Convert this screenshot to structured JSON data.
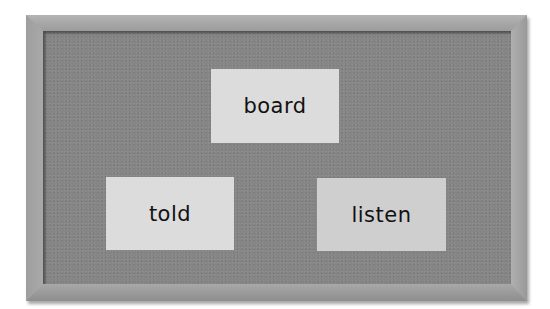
{
  "board": {
    "frame_color": "#a3a3a3",
    "felt_color": "#858585",
    "cards": [
      {
        "word": "board",
        "color": "#dcdcdc"
      },
      {
        "word": "told",
        "color": "#dcdcdc"
      },
      {
        "word": "listen",
        "color": "#cfcfcf"
      }
    ]
  }
}
